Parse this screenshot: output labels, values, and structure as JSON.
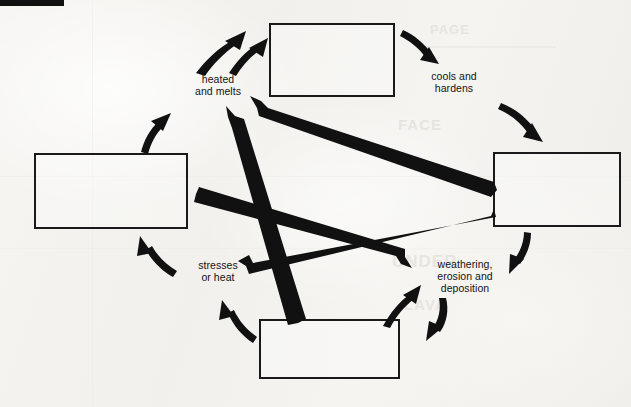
{
  "figure": {
    "type": "cycle-diagram",
    "background_color": "#f4f3f0",
    "ink_color": "#111111",
    "rule": {
      "name": "top-left-rule",
      "x": 0,
      "y": 0,
      "width": 64,
      "height": 6
    }
  },
  "boxes": [
    {
      "id": "top",
      "label": "",
      "x": 269,
      "y": 23,
      "width": 126,
      "height": 74
    },
    {
      "id": "right",
      "label": "",
      "x": 493,
      "y": 152,
      "width": 128,
      "height": 75
    },
    {
      "id": "bottom",
      "label": "",
      "x": 259,
      "y": 319,
      "width": 141,
      "height": 60
    },
    {
      "id": "left",
      "label": "",
      "x": 34,
      "y": 153,
      "width": 154,
      "height": 76
    }
  ],
  "labels": [
    {
      "id": "heated-and-melts",
      "text": "heated\nand melts",
      "x": 172,
      "y": 73,
      "width": 92
    },
    {
      "id": "cools-and-hardens",
      "text": "cools and\nhardens",
      "x": 408,
      "y": 70,
      "width": 92
    },
    {
      "id": "weathering",
      "text": "weathering,\nerosion and\ndeposition",
      "x": 418,
      "y": 258,
      "width": 94
    },
    {
      "id": "stresses-or-heat",
      "text": "stresses\nor heat",
      "x": 176,
      "y": 259,
      "width": 84
    }
  ],
  "curved_arrows": [
    {
      "id": "left-to-top",
      "from": "left-box",
      "to": "top-box",
      "via_label": "heated-and-melts"
    },
    {
      "id": "top-to-right",
      "from": "top-box",
      "to": "right-box",
      "via_label": "cools-and-hardens"
    },
    {
      "id": "right-box-inflow",
      "from": "cools-and-hardens",
      "to": "right-box",
      "via_label": "cools-and-hardens"
    },
    {
      "id": "right-to-weathering",
      "from": "right-box",
      "to": "weathering",
      "via_label": "weathering"
    },
    {
      "id": "weathering-to-bottom",
      "from": "weathering",
      "to": "bottom-box",
      "via_label": "weathering"
    },
    {
      "id": "bottom-to-weathering",
      "from": "bottom-box",
      "to": "weathering",
      "via_label": "weathering"
    },
    {
      "id": "bottom-to-stresses",
      "from": "bottom-box",
      "to": "stresses-or-heat",
      "via_label": "stresses-or-heat"
    },
    {
      "id": "stresses-to-left",
      "from": "stresses-or-heat",
      "to": "left-box",
      "via_label": "stresses-or-heat"
    }
  ],
  "straight_arrows": [
    {
      "id": "right-box-to-heated",
      "from": "right-box",
      "to": "heated-and-melts"
    },
    {
      "id": "bottom-box-to-heated",
      "from": "bottom-box",
      "to": "heated-and-melts"
    },
    {
      "id": "left-box-to-weathering",
      "from": "left-box",
      "to": "weathering"
    },
    {
      "id": "right-box-to-stresses",
      "from": "right-box",
      "to": "stresses-or-heat"
    }
  ],
  "bleed_through": [
    {
      "text": "PAGE",
      "x": 430,
      "y": 28,
      "size": 13
    },
    {
      "text": "FACE",
      "x": 398,
      "y": 122,
      "size": 15
    },
    {
      "text": "UNDER",
      "x": 392,
      "y": 258,
      "size": 17
    },
    {
      "text": "LAVA",
      "x": 404,
      "y": 300,
      "size": 15
    }
  ]
}
